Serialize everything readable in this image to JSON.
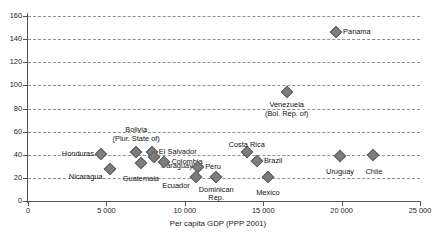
{
  "chart_data": {
    "type": "scatter",
    "title": "",
    "xlabel": "Per capita GDP (PPP 2001)",
    "ylabel": "",
    "xlim": [
      0,
      25000
    ],
    "ylim": [
      0,
      160
    ],
    "xticks": [
      0,
      5000,
      10000,
      15000,
      20000,
      25000
    ],
    "xtick_labels": [
      "0",
      "5 000",
      "10 000",
      "15 000",
      "20 000",
      "25 000"
    ],
    "yticks": [
      0,
      20,
      40,
      60,
      80,
      100,
      120,
      140,
      160
    ],
    "ytick_labels": [
      "0",
      "20",
      "40",
      "60",
      "80",
      "100",
      "120",
      "140",
      "160"
    ],
    "grid": "horizontal-dashed",
    "legend": "none",
    "marker": "diamond",
    "marker_color": "#7d7d7d",
    "points": [
      {
        "label": "Honduras",
        "x": 4650,
        "y": 41,
        "label_pos": "right",
        "label_dx": -7,
        "label_dy": -4
      },
      {
        "label": "Nicaragua",
        "x": 5200,
        "y": 28,
        "label_pos": "right",
        "label_dx": -7,
        "label_dy": 4
      },
      {
        "label": "Bolivia\n(Plur. State of)",
        "x": 6900,
        "y": 42,
        "label_pos": "center",
        "label_dx": 0,
        "label_dy": -22
      },
      {
        "label": "El Salvador",
        "x": 7900,
        "y": 42,
        "label_pos": "left",
        "label_dx": 7,
        "label_dy": -4
      },
      {
        "label": "Guatemala",
        "x": 7200,
        "y": 33,
        "label_pos": "center",
        "label_dx": 0,
        "label_dy": 12
      },
      {
        "label": "Paraguay",
        "x": 8050,
        "y": 38,
        "label_pos": "left",
        "label_dx": 7,
        "label_dy": 5
      },
      {
        "label": "Colombia",
        "x": 8700,
        "y": 34,
        "label_pos": "left",
        "label_dx": 7,
        "label_dy": -4
      },
      {
        "label": "Ecuador",
        "x": 10700,
        "y": 21,
        "label_pos": "right",
        "label_dx": -6,
        "label_dy": 5
      },
      {
        "label": "Peru",
        "x": 10850,
        "y": 29,
        "label_pos": "left",
        "label_dx": 7,
        "label_dy": -4
      },
      {
        "label": "Dominican\nRep.",
        "x": 12000,
        "y": 21,
        "label_pos": "center",
        "label_dx": 0,
        "label_dy": 13
      },
      {
        "label": "Costa Rica",
        "x": 13950,
        "y": 42,
        "label_pos": "center",
        "label_dx": 0,
        "label_dy": -11
      },
      {
        "label": "Brazil",
        "x": 14600,
        "y": 35,
        "label_pos": "left",
        "label_dx": 7,
        "label_dy": -4
      },
      {
        "label": "Mexico",
        "x": 15300,
        "y": 21,
        "label_pos": "center",
        "label_dx": 0,
        "label_dy": 12
      },
      {
        "label": "Venezuela\n(Bol. Rep. of)",
        "x": 16500,
        "y": 94,
        "label_pos": "center",
        "label_dx": 0,
        "label_dy": 13
      },
      {
        "label": "Uruguay",
        "x": 19900,
        "y": 39,
        "label_pos": "center",
        "label_dx": 0,
        "label_dy": 12
      },
      {
        "label": "Chile",
        "x": 22000,
        "y": 40,
        "label_pos": "center",
        "label_dx": 1,
        "label_dy": 13
      },
      {
        "label": "Panama",
        "x": 19650,
        "y": 146,
        "label_pos": "left",
        "label_dx": 7,
        "label_dy": -4
      }
    ]
  }
}
